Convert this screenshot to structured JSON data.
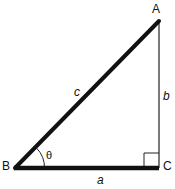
{
  "diagram": {
    "type": "right-triangle",
    "vertices": {
      "A": {
        "label": "A"
      },
      "B": {
        "label": "B"
      },
      "C": {
        "label": "C"
      }
    },
    "sides": {
      "a": {
        "label": "a",
        "from": "B",
        "to": "C"
      },
      "b": {
        "label": "b",
        "from": "C",
        "to": "A"
      },
      "c": {
        "label": "c",
        "from": "B",
        "to": "A"
      }
    },
    "angle": {
      "label": "θ",
      "at": "B"
    },
    "right_angle_at": "C",
    "colors": {
      "stroke": "#111111",
      "background": "#ffffff"
    }
  }
}
